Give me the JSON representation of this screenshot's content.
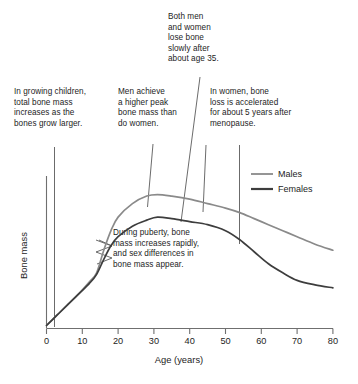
{
  "figure": {
    "annotations": {
      "top": "Both men\nand women\nlose bone\nslowly after\nabout age 35.",
      "children": "In growing children,\ntotal bone mass\nincreases as the\nbones grow larger.",
      "men": "Men achieve\na higher peak\nbone mass than\ndo women.",
      "women": "In women, bone\nloss is accelerated\nfor about 5 years after\nmenopause.",
      "puberty": "During puberty, bone\nmass increases rapidly,\nand sex differences in\nbone mass appear."
    },
    "legend": {
      "males_label": "Males",
      "females_label": "Females"
    },
    "axes": {
      "x_title": "Age (years)",
      "y_title": "Bone mass",
      "x_ticks": [
        "0",
        "10",
        "20",
        "30",
        "40",
        "50",
        "60",
        "70",
        "80"
      ]
    },
    "colors": {
      "males_line": "#8a8a8a",
      "females_line": "#3d3d3d",
      "axis": "#6f6f6f",
      "leader": "#5a5a5a",
      "text": "#1d1d1d",
      "background": "#ffffff"
    }
  },
  "chart_data": {
    "type": "line",
    "title": "",
    "xlabel": "Age (years)",
    "ylabel": "Bone mass",
    "xlim": [
      0,
      80
    ],
    "ylim": [
      0,
      100
    ],
    "grid": false,
    "legend_position": "upper-right",
    "x_ticks": [
      0,
      10,
      20,
      30,
      40,
      50,
      60,
      70,
      80
    ],
    "y_ticks": [],
    "x": [
      0,
      3,
      6,
      9,
      12,
      14,
      16,
      18,
      20,
      24,
      28,
      31,
      35,
      40,
      45,
      50,
      54,
      58,
      62,
      66,
      70,
      75,
      80
    ],
    "series": [
      {
        "name": "Males",
        "color": "#8a8a8a",
        "values": [
          2,
          9,
          16,
          23,
          31,
          37,
          52,
          65,
          74,
          83,
          88,
          89,
          88,
          86,
          83,
          80,
          77,
          73,
          69,
          65,
          61,
          56,
          52
        ]
      },
      {
        "name": "Females",
        "color": "#3d3d3d",
        "values": [
          2,
          9,
          16,
          23,
          30,
          36,
          46,
          55,
          61,
          68,
          72,
          74,
          73,
          71,
          69,
          65,
          59,
          51,
          43,
          37,
          32,
          29,
          27
        ]
      }
    ],
    "annotations": [
      {
        "name": "children",
        "text": "In growing children, total bone mass increases as the bones grow larger.",
        "points_to_age": 3
      },
      {
        "name": "men",
        "text": "Men achieve a higher peak bone mass than do women.",
        "points_to_age": 31
      },
      {
        "name": "top",
        "text": "Both men and women lose bone slowly after about age 35.",
        "points_to_age": 39
      },
      {
        "name": "women",
        "text": "In women, bone loss is accelerated for about 5 years after menopause.",
        "points_to_age": 54
      },
      {
        "name": "puberty",
        "text": "During puberty, bone mass increases rapidly, and sex differences in bone mass appear.",
        "points_to_age": 15
      }
    ]
  }
}
